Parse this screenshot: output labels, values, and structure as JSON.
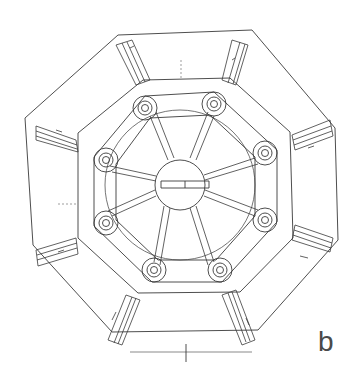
{
  "figure": {
    "panel_label": "b",
    "stroke_color": "#3a3a3a",
    "background": "#ffffff"
  },
  "geometry": {
    "center": [
      180,
      183
    ],
    "outer_octagon": [
      [
        118,
        35
      ],
      [
        252,
        30
      ],
      [
        335,
        128
      ],
      [
        338,
        240
      ],
      [
        258,
        330
      ],
      [
        112,
        332
      ],
      [
        33,
        245
      ],
      [
        25,
        118
      ]
    ],
    "inner_octagon": [
      [
        143,
        80
      ],
      [
        230,
        78
      ],
      [
        290,
        132
      ],
      [
        293,
        238
      ],
      [
        240,
        292
      ],
      [
        138,
        293
      ],
      [
        78,
        238
      ],
      [
        78,
        133
      ]
    ],
    "bolt_circles": [
      [
        145,
        108
      ],
      [
        214,
        104
      ],
      [
        265,
        153
      ],
      [
        265,
        220
      ],
      [
        220,
        270
      ],
      [
        154,
        270
      ],
      [
        106,
        223
      ],
      [
        106,
        160
      ]
    ],
    "hub_radius": 25,
    "bolt_outer_r": 12,
    "bolt_inner_r": 7,
    "bolt_core_r": 3.5
  }
}
